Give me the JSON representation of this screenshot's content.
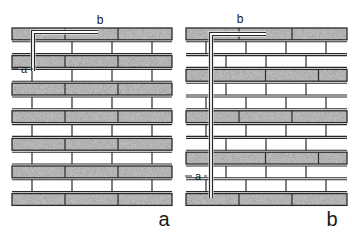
{
  "figure": {
    "panels": [
      {
        "id": "a",
        "caption": "a",
        "dim_top_label": "b",
        "dim_side_label": "a",
        "x": 12,
        "y": 27,
        "width": 160,
        "course_height": 13.8,
        "courses": 13,
        "shaded_pattern": "alternate",
        "element": {
          "vertical_x": 33,
          "top_y": 32,
          "bottom_y": 71,
          "horizontal_end_x": 98
        },
        "side_label_y": 69
      },
      {
        "id": "b",
        "caption": "b",
        "dim_top_label": "b",
        "dim_side_label": "a",
        "x": 186,
        "y": 27,
        "width": 161,
        "course_height": 13.8,
        "courses": 13,
        "shaded_pattern": "every-third",
        "element": {
          "vertical_x": 211,
          "top_y": 34,
          "bottom_y": 198,
          "horizontal_end_x": 266
        },
        "side_label_y": 176
      }
    ],
    "colors": {
      "line": "#2a2a2a",
      "shade": "#bdbdbd",
      "white_brick": "#ffffff"
    }
  }
}
